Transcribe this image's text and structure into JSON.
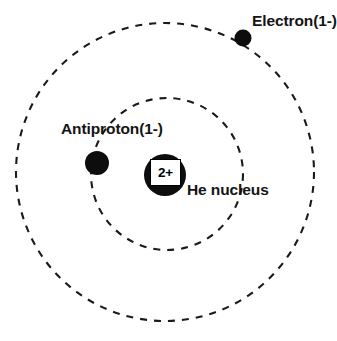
{
  "diagram": {
    "background_color": "#ffffff",
    "stroke_color": "#1a1a1a",
    "particle_color": "#0d0d0d",
    "width": 337,
    "height": 341
  },
  "labels": {
    "electron": "Electron(1-)",
    "antiproton": "Antiproton(1-)",
    "he_nucleus": "He nucleus",
    "nucleus_charge": "2+"
  },
  "chart_data": {
    "type": "scatter",
    "xlabel": "",
    "ylabel": "",
    "orbits": [
      {
        "name": "outer-orbit",
        "occupant": "Electron(1-)",
        "center_x": 165,
        "center_y": 172,
        "radius": 149,
        "style": "dashed",
        "dash_pattern": "7 7",
        "stroke_width": 2.1
      },
      {
        "name": "inner-orbit",
        "occupant": "Antiproton(1-)",
        "center_x": 167,
        "center_y": 174,
        "radius": 76,
        "style": "dashed",
        "dash_pattern": "7 7",
        "stroke_width": 2.1
      }
    ],
    "particles": [
      {
        "name": "he-nucleus",
        "label": "He nucleus",
        "charge": "2+",
        "x": 165,
        "y": 175,
        "radius": 21,
        "color": "#0d0d0d"
      },
      {
        "name": "electron",
        "label": "Electron(1-)",
        "charge": "1-",
        "x": 243,
        "y": 38,
        "radius": 8.5,
        "color": "#0d0d0d"
      },
      {
        "name": "antiproton",
        "label": "Antiproton(1-)",
        "charge": "1-",
        "x": 97,
        "y": 163,
        "radius": 12,
        "color": "#0d0d0d"
      }
    ]
  }
}
